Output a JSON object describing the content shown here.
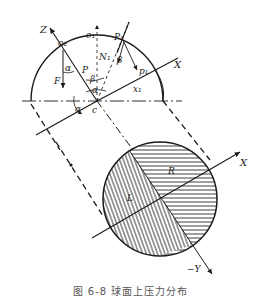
{
  "figure": {
    "caption": "图 6-8  球面上压力分布",
    "labels": {
      "Z": "Z",
      "o2": "o₂",
      "o1": "o₁",
      "P1": "P₁",
      "N1": "N₁",
      "beta_top": "β",
      "p1": "p₁",
      "X_top": "X",
      "alpha_left": "α",
      "P": "P",
      "F": "F",
      "beta_mid": "β",
      "alpha_mid": "α",
      "x1": "x₁",
      "alpha_bottom": "α",
      "c": "c",
      "R": "R",
      "L": "L",
      "X_bottom": "X",
      "negY": "−Y"
    },
    "colors": {
      "line": "#1a1a1a",
      "hatch": "#2a2a2a",
      "caption": "#555555"
    }
  }
}
